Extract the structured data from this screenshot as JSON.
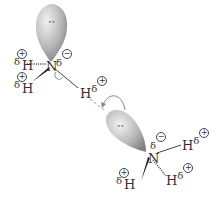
{
  "molecule1": {
    "central_atom": "N",
    "central_charge": "δ",
    "central_charge_sign": "−",
    "hydrogens": [
      {
        "label": "H",
        "delta": "δ",
        "sign": "+"
      },
      {
        "label": "H",
        "delta": "δ",
        "sign": "+"
      },
      {
        "label": "H",
        "delta": "δ",
        "sign": "+"
      }
    ],
    "lone_pair": "••"
  },
  "molecule2": {
    "central_atom": "N",
    "central_charge": "δ",
    "central_charge_sign": "−",
    "hydrogens": [
      {
        "label": "H",
        "delta": "δ",
        "sign": "+"
      },
      {
        "label": "H",
        "delta": "δ",
        "sign": "+"
      },
      {
        "label": "H",
        "delta": "δ",
        "sign": "+"
      }
    ],
    "lone_pair": "••"
  },
  "colors": {
    "orbital_light": "#e6e6e6",
    "orbital_dark": "#8a8a8a",
    "bond": "#333333",
    "hbond": "#aaaaaa"
  }
}
